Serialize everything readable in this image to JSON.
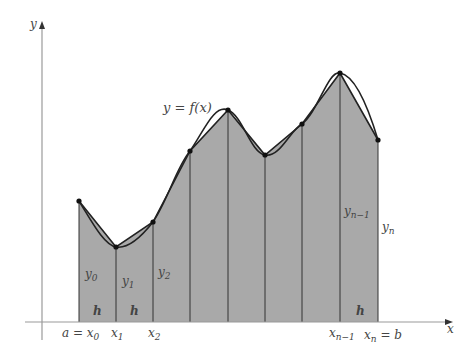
{
  "figure": {
    "curve_label": "y = f(x)",
    "axes": {
      "x_label": "x",
      "y_label": "y"
    },
    "colors": {
      "fill": "#a9a9a9",
      "line": "#222222",
      "axis": "#9a9a9a",
      "text": "#444444"
    },
    "x_tick_labels": [
      {
        "text": "a = x",
        "sub": "0"
      },
      {
        "text": "x",
        "sub": "1"
      },
      {
        "text": "x",
        "sub": "2"
      },
      {
        "text": "x",
        "sub": "n−1"
      },
      {
        "text": "x",
        "sub": "n",
        "suffix": " = b"
      }
    ],
    "ordinate_labels": [
      {
        "text": "y",
        "sub": "0"
      },
      {
        "text": "y",
        "sub": "1"
      },
      {
        "text": "y",
        "sub": "2"
      },
      {
        "text": "y",
        "sub": "n−1"
      },
      {
        "text": "y",
        "sub": "n"
      }
    ],
    "width_labels": [
      "h",
      "h",
      "h"
    ],
    "points": [
      [
        79,
        201
      ],
      [
        116,
        247
      ],
      [
        153,
        222
      ],
      [
        190,
        151
      ],
      [
        228,
        110
      ],
      [
        265,
        155
      ],
      [
        302,
        124
      ],
      [
        340,
        73
      ],
      [
        378,
        140
      ]
    ]
  }
}
